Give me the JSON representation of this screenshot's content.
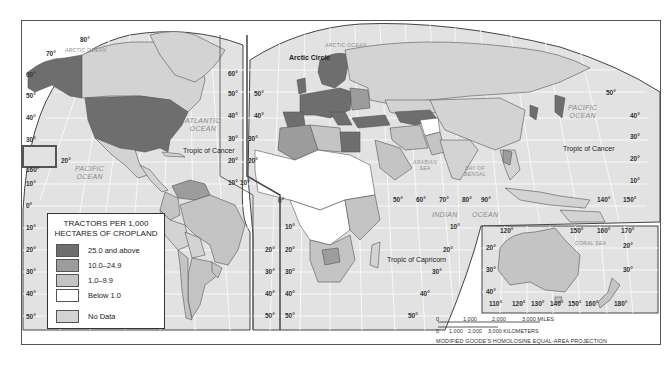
{
  "map": {
    "title": "Tractors per 1,000 Hectares of Cropland",
    "projection_note": "MODIFIED GOODE'S HOMOLOSINE EQUAL-AREA PROJECTION",
    "colors": {
      "class_25_plus": "#6e6e6e",
      "class_10_24": "#9c9c9c",
      "class_1_9": "#c4c4c4",
      "class_below_1": "#ffffff",
      "no_data": "#d3d3d3",
      "ocean": "#e2e2e2",
      "graticule": "#f7f7f7",
      "border": "#555555"
    },
    "labels": {
      "arctic_circle": "Arctic Circle",
      "tropic_cancer_west": "Tropic of Cancer",
      "tropic_cancer_east": "Tropic of Cancer",
      "tropic_capricorn": "Tropic of Capricorn"
    },
    "oceans": {
      "arctic_west": "ARCTIC OCEAN",
      "arctic_east": "ARCTIC OCEAN",
      "atlantic_line1": "ATLANTIC",
      "atlantic_line2": "OCEAN",
      "pacific_west_line1": "PACIFIC",
      "pacific_west_line2": "OCEAN",
      "pacific_east_line1": "PACIFIC",
      "pacific_east_line2": "OCEAN",
      "indian_line1": "INDIAN",
      "indian_line2": "OCEAN",
      "arabian_line1": "ARABIAN",
      "arabian_line2": "SEA",
      "bengal_line1": "BAY OF",
      "bengal_line2": "BENGAL",
      "coral_sea": "CORAL SEA"
    },
    "degrees": {
      "west_lat_left": [
        "60°",
        "50°",
        "40°",
        "30°",
        "20°",
        "10°",
        "0°",
        "10°",
        "20°",
        "30°",
        "40°",
        "50°"
      ],
      "top_80": "80°",
      "top_70": "70°",
      "hawaii_160": "160°",
      "hawaii_20": "20°",
      "mid_lat_americas_right": [
        "60°",
        "50°",
        "40°",
        "30°",
        "20°",
        "10°"
      ],
      "mid_lat_eurasia_left": [
        "50°",
        "40°",
        "30°",
        "20°",
        "10°"
      ],
      "sa_right": [
        "20°",
        "30°",
        "40°",
        "50°"
      ],
      "africa_left": [
        "0°",
        "10°",
        "20°",
        "30°",
        "40°",
        "50°"
      ],
      "africa_right": [
        "10°",
        "20°",
        "30°",
        "40°",
        "50°"
      ],
      "lon_row": [
        "50°",
        "60°",
        "70°",
        "80°",
        "90°"
      ],
      "lon_pacific": [
        "140°",
        "150°"
      ],
      "asia_right_lat": [
        "50°",
        "40°",
        "30°",
        "20°",
        "10°"
      ],
      "inset_top": [
        "120°",
        "150°",
        "160°",
        "170°"
      ],
      "inset_bottom": [
        "110°",
        "120°",
        "130°",
        "140°",
        "150°",
        "160°",
        "180°"
      ],
      "inset_left": [
        "20°",
        "30°",
        "40°"
      ],
      "inset_right": [
        "20°",
        "30°"
      ]
    }
  },
  "legend": {
    "title_line1": "TRACTORS PER 1,000",
    "title_line2": "HECTARES OF CROPLAND",
    "items": [
      {
        "label": "25.0 and above",
        "color": "#6e6e6e"
      },
      {
        "label": "10.0–24.9",
        "color": "#9c9c9c"
      },
      {
        "label": "1.0–9.9",
        "color": "#c4c4c4"
      },
      {
        "label": "Below 1.0",
        "color": "#ffffff"
      },
      {
        "label": "No Data",
        "color": "#d3d3d3"
      }
    ]
  },
  "scale_bar": {
    "miles_ticks": [
      "0",
      "1,000",
      "2,000",
      "3,000 MILES"
    ],
    "km_ticks": [
      "0",
      "1,000",
      "2,000",
      "3,000 KILOMETERS"
    ]
  }
}
